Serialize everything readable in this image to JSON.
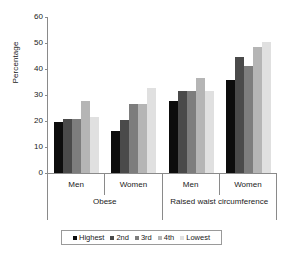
{
  "chart_data": {
    "type": "bar",
    "title": "",
    "xlabel": "",
    "ylabel": "Percentage",
    "ylim": [
      0,
      60
    ],
    "ytick_step": 10,
    "yticks": [
      60,
      50,
      40,
      30,
      20,
      10,
      0
    ],
    "grid": false,
    "legend_position": "bottom",
    "categories": [
      "Men",
      "Women",
      "Men",
      "Women"
    ],
    "supercategories": [
      {
        "label": "Obese",
        "span": 2
      },
      {
        "label": "Raised waist circumference",
        "span": 2
      }
    ],
    "series": [
      {
        "name": "Highest",
        "color": "#0d0d0d",
        "values": [
          19.7,
          16.3,
          27.6,
          35.7
        ]
      },
      {
        "name": "2nd",
        "color": "#4a4a4a",
        "values": [
          20.8,
          20.4,
          31.4,
          44.5
        ]
      },
      {
        "name": "3rd",
        "color": "#7d7d7d",
        "values": [
          20.8,
          26.7,
          31.4,
          41.3
        ]
      },
      {
        "name": "4th",
        "color": "#b5b5b5",
        "values": [
          27.7,
          26.7,
          36.4,
          48.6
        ]
      },
      {
        "name": "Lowest",
        "color": "#e0e0e0",
        "values": [
          21.5,
          32.8,
          31.4,
          50.2
        ]
      }
    ]
  },
  "legend": {
    "items": [
      {
        "label": "Highest",
        "color": "#0d0d0d"
      },
      {
        "label": "2nd",
        "color": "#4a4a4a"
      },
      {
        "label": "3rd",
        "color": "#7d7d7d"
      },
      {
        "label": "4th",
        "color": "#b5b5b5"
      },
      {
        "label": "Lowest",
        "color": "#e0e0e0"
      }
    ]
  },
  "axis": {
    "y_title": "Percentage"
  }
}
